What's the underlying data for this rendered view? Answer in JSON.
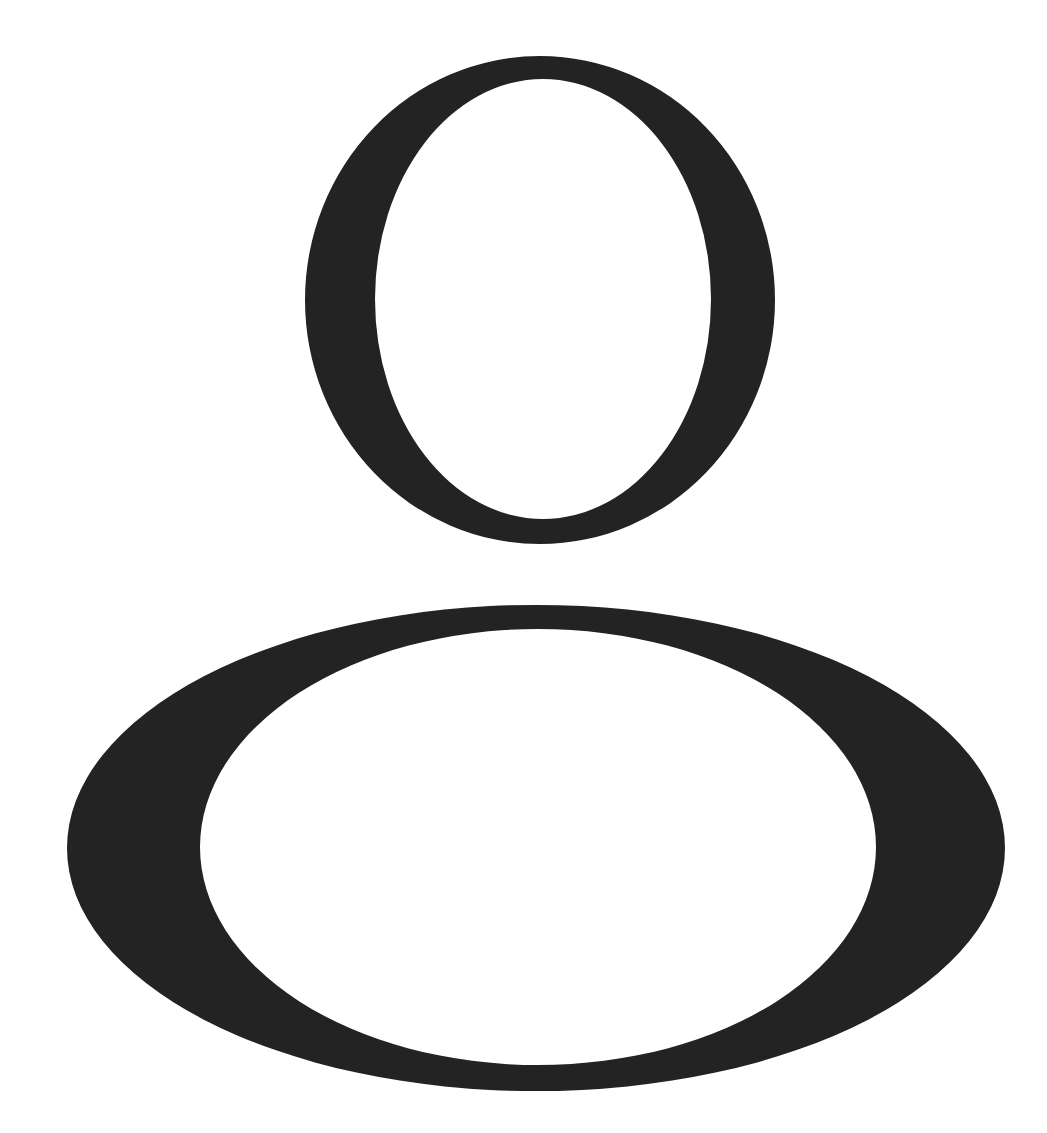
{
  "figure": {
    "label": "User avatar icon",
    "icon": "user-icon",
    "background_color": "#ffffff",
    "ink_color": "#232323",
    "parts": {
      "head": {
        "name": "head-ring",
        "outer": {
          "cx": 540,
          "cy": 300,
          "rx": 235,
          "ry": 244
        },
        "inner": {
          "cx": 543,
          "cy": 299,
          "rx": 168,
          "ry": 220
        }
      },
      "body": {
        "name": "body-ring",
        "outer": {
          "cx": 536,
          "cy": 848,
          "rx": 469,
          "ry": 243
        },
        "inner": {
          "cx": 538,
          "cy": 847,
          "rx": 338,
          "ry": 218
        }
      }
    }
  }
}
